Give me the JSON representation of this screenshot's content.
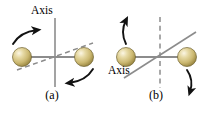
{
  "figure": {
    "background_color": "#ffffff",
    "width": 208,
    "height": 113,
    "colors": {
      "rod": "#8c8c8c",
      "axis_line": "#8c8c8c",
      "dashed_line": "#8c8c8c",
      "arrow": "#121212",
      "sphere_highlight": "#f2ead0",
      "sphere_mid": "#d8c98a",
      "sphere_edge": "#9a8745",
      "sphere_outline": "#6f6130",
      "text": "#000000"
    }
  },
  "panels": [
    {
      "id": "a",
      "caption": "(a)",
      "axis_label": "Axis",
      "axis_style": "solid",
      "axis_orientation": "vertical",
      "secondary_line_style": "dashed",
      "secondary_line_orientation": "tilted",
      "spheres": [
        {
          "position": "left",
          "label": "sphere-left"
        },
        {
          "position": "right",
          "label": "sphere-right"
        }
      ],
      "arrows": [
        {
          "id": "arrow-upper-left",
          "direction": "up-right",
          "near": "left-sphere"
        },
        {
          "id": "arrow-lower-right",
          "direction": "down-left",
          "near": "right-sphere"
        }
      ]
    },
    {
      "id": "b",
      "caption": "(b)",
      "axis_label": "Axis",
      "axis_style": "solid",
      "axis_orientation": "tilted",
      "secondary_line_style": "dashed",
      "secondary_line_orientation": "vertical",
      "spheres": [
        {
          "position": "left",
          "label": "sphere-left"
        },
        {
          "position": "right",
          "label": "sphere-right"
        }
      ],
      "arrows": [
        {
          "id": "arrow-upper-left",
          "direction": "up-left",
          "near": "left-sphere"
        },
        {
          "id": "arrow-lower-right",
          "direction": "down-right",
          "near": "right-sphere"
        }
      ]
    }
  ]
}
